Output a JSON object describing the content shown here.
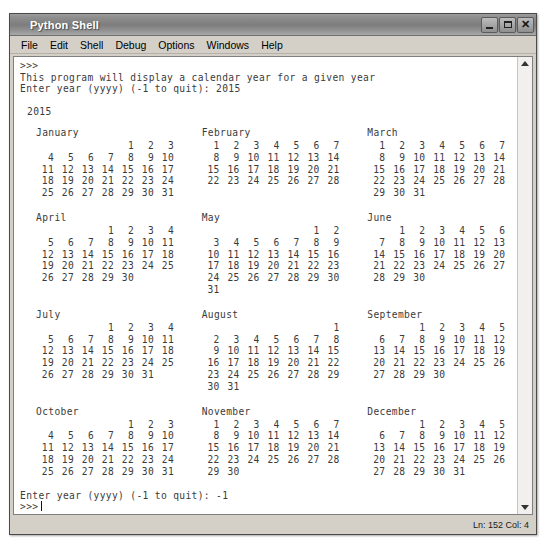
{
  "window": {
    "title": "Python Shell",
    "controls": [
      {
        "name": "minimize-button",
        "glyph": "minimize"
      },
      {
        "name": "maximize-button",
        "glyph": "maximize"
      },
      {
        "name": "close-button",
        "glyph": "close"
      }
    ]
  },
  "menubar": {
    "items": [
      "File",
      "Edit",
      "Shell",
      "Debug",
      "Options",
      "Windows",
      "Help"
    ]
  },
  "console": {
    "prompt_top": ">>>",
    "line_program": "This program will display a calendar year for a given year",
    "line_input_prompt": "Enter year (yyyy) (-1 to quit): 2015",
    "year_heading": "2015",
    "line_quit_prompt": "Enter year (yyyy) (-1 to quit): -1",
    "prompt_bottom": ">>>"
  },
  "calendar": {
    "year": "2015",
    "rows": [
      [
        {
          "name": "January",
          "weeks": [
            [
              "",
              "",
              "",
              "",
              "1",
              "2",
              "3"
            ],
            [
              "4",
              "5",
              "6",
              "7",
              "8",
              "9",
              "10"
            ],
            [
              "11",
              "12",
              "13",
              "14",
              "15",
              "16",
              "17"
            ],
            [
              "18",
              "19",
              "20",
              "21",
              "22",
              "23",
              "24"
            ],
            [
              "25",
              "26",
              "27",
              "28",
              "29",
              "30",
              "31"
            ]
          ]
        },
        {
          "name": "February",
          "weeks": [
            [
              "1",
              "2",
              "3",
              "4",
              "5",
              "6",
              "7"
            ],
            [
              "8",
              "9",
              "10",
              "11",
              "12",
              "13",
              "14"
            ],
            [
              "15",
              "16",
              "17",
              "18",
              "19",
              "20",
              "21"
            ],
            [
              "22",
              "23",
              "24",
              "25",
              "26",
              "27",
              "28"
            ]
          ]
        },
        {
          "name": "March",
          "weeks": [
            [
              "1",
              "2",
              "3",
              "4",
              "5",
              "6",
              "7"
            ],
            [
              "8",
              "9",
              "10",
              "11",
              "12",
              "13",
              "14"
            ],
            [
              "15",
              "16",
              "17",
              "18",
              "19",
              "20",
              "21"
            ],
            [
              "22",
              "23",
              "24",
              "25",
              "26",
              "27",
              "28"
            ],
            [
              "29",
              "30",
              "31",
              "",
              "",
              "",
              ""
            ]
          ]
        }
      ],
      [
        {
          "name": "April",
          "weeks": [
            [
              "",
              "",
              "",
              "1",
              "2",
              "3",
              "4"
            ],
            [
              "5",
              "6",
              "7",
              "8",
              "9",
              "10",
              "11"
            ],
            [
              "12",
              "13",
              "14",
              "15",
              "16",
              "17",
              "18"
            ],
            [
              "19",
              "20",
              "21",
              "22",
              "23",
              "24",
              "25"
            ],
            [
              "26",
              "27",
              "28",
              "29",
              "30",
              "",
              ""
            ]
          ]
        },
        {
          "name": "May",
          "weeks": [
            [
              "",
              "",
              "",
              "",
              "",
              "1",
              "2"
            ],
            [
              "3",
              "4",
              "5",
              "6",
              "7",
              "8",
              "9"
            ],
            [
              "10",
              "11",
              "12",
              "13",
              "14",
              "15",
              "16"
            ],
            [
              "17",
              "18",
              "19",
              "20",
              "21",
              "22",
              "23"
            ],
            [
              "24",
              "25",
              "26",
              "27",
              "28",
              "29",
              "30"
            ],
            [
              "31",
              "",
              "",
              "",
              "",
              "",
              ""
            ]
          ]
        },
        {
          "name": "June",
          "weeks": [
            [
              "",
              "1",
              "2",
              "3",
              "4",
              "5",
              "6"
            ],
            [
              "7",
              "8",
              "9",
              "10",
              "11",
              "12",
              "13"
            ],
            [
              "14",
              "15",
              "16",
              "17",
              "18",
              "19",
              "20"
            ],
            [
              "21",
              "22",
              "23",
              "24",
              "25",
              "26",
              "27"
            ],
            [
              "28",
              "29",
              "30",
              "",
              "",
              "",
              ""
            ]
          ]
        }
      ],
      [
        {
          "name": "July",
          "weeks": [
            [
              "",
              "",
              "",
              "1",
              "2",
              "3",
              "4"
            ],
            [
              "5",
              "6",
              "7",
              "8",
              "9",
              "10",
              "11"
            ],
            [
              "12",
              "13",
              "14",
              "15",
              "16",
              "17",
              "18"
            ],
            [
              "19",
              "20",
              "21",
              "22",
              "23",
              "24",
              "25"
            ],
            [
              "26",
              "27",
              "28",
              "29",
              "30",
              "31",
              ""
            ]
          ]
        },
        {
          "name": "August",
          "weeks": [
            [
              "",
              "",
              "",
              "",
              "",
              "",
              "1"
            ],
            [
              "2",
              "3",
              "4",
              "5",
              "6",
              "7",
              "8"
            ],
            [
              "9",
              "10",
              "11",
              "12",
              "13",
              "14",
              "15"
            ],
            [
              "16",
              "17",
              "18",
              "19",
              "20",
              "21",
              "22"
            ],
            [
              "23",
              "24",
              "25",
              "26",
              "27",
              "28",
              "29"
            ],
            [
              "30",
              "31",
              "",
              "",
              "",
              "",
              ""
            ]
          ]
        },
        {
          "name": "September",
          "weeks": [
            [
              "",
              "",
              "1",
              "2",
              "3",
              "4",
              "5"
            ],
            [
              "6",
              "7",
              "8",
              "9",
              "10",
              "11",
              "12"
            ],
            [
              "13",
              "14",
              "15",
              "16",
              "17",
              "18",
              "19"
            ],
            [
              "20",
              "21",
              "22",
              "23",
              "24",
              "25",
              "26"
            ],
            [
              "27",
              "28",
              "29",
              "30",
              "",
              "",
              ""
            ]
          ]
        }
      ],
      [
        {
          "name": "October",
          "weeks": [
            [
              "",
              "",
              "",
              "",
              "1",
              "2",
              "3"
            ],
            [
              "4",
              "5",
              "6",
              "7",
              "8",
              "9",
              "10"
            ],
            [
              "11",
              "12",
              "13",
              "14",
              "15",
              "16",
              "17"
            ],
            [
              "18",
              "19",
              "20",
              "21",
              "22",
              "23",
              "24"
            ],
            [
              "25",
              "26",
              "27",
              "28",
              "29",
              "30",
              "31"
            ]
          ]
        },
        {
          "name": "November",
          "weeks": [
            [
              "1",
              "2",
              "3",
              "4",
              "5",
              "6",
              "7"
            ],
            [
              "8",
              "9",
              "10",
              "11",
              "12",
              "13",
              "14"
            ],
            [
              "15",
              "16",
              "17",
              "18",
              "19",
              "20",
              "21"
            ],
            [
              "22",
              "23",
              "24",
              "25",
              "26",
              "27",
              "28"
            ],
            [
              "29",
              "30",
              "",
              "",
              "",
              "",
              ""
            ]
          ]
        },
        {
          "name": "December",
          "weeks": [
            [
              "",
              "",
              "1",
              "2",
              "3",
              "4",
              "5"
            ],
            [
              "6",
              "7",
              "8",
              "9",
              "10",
              "11",
              "12"
            ],
            [
              "13",
              "14",
              "15",
              "16",
              "17",
              "18",
              "19"
            ],
            [
              "20",
              "21",
              "22",
              "23",
              "24",
              "25",
              "26"
            ],
            [
              "27",
              "28",
              "29",
              "30",
              "31",
              "",
              ""
            ]
          ]
        }
      ]
    ]
  },
  "scrollbar": {
    "up_arrow": "scroll-up-arrow",
    "down_arrow": "scroll-down-arrow"
  },
  "statusbar": {
    "position": "Ln: 152 Col: 4"
  }
}
